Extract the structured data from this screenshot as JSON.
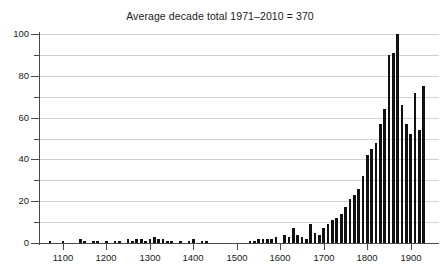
{
  "chart": {
    "title": "Average decade total 1971–2010 = 370",
    "bar_color": "#111111",
    "grid_color": "#d2d2d2",
    "axis_color": "#4a4a4a",
    "background": "#ffffff"
  },
  "chart_data": {
    "type": "bar",
    "title": "Average decade total 1971–2010 = 370",
    "xlabel": "",
    "ylabel": "",
    "xlim": [
      1045,
      1965
    ],
    "ylim": [
      0,
      100
    ],
    "grid": true,
    "grid_interval": 10,
    "legend": null,
    "x_tick_labels": [
      "1100",
      "1200",
      "1300",
      "1400",
      "1500",
      "1600",
      "1700",
      "1800",
      "1900"
    ],
    "x_tick_values": [
      1100,
      1200,
      1300,
      1400,
      1500,
      1600,
      1700,
      1800,
      1900
    ],
    "y_tick_labels": [
      "0",
      "20",
      "40",
      "60",
      "80",
      "100"
    ],
    "y_tick_values": [
      0,
      20,
      40,
      60,
      80,
      100
    ],
    "y_minor_tick_values": [
      10,
      30,
      50,
      70,
      90
    ],
    "bin_width_years": 10,
    "x": [
      1050,
      1060,
      1070,
      1080,
      1090,
      1100,
      1110,
      1120,
      1130,
      1140,
      1150,
      1160,
      1170,
      1180,
      1190,
      1200,
      1210,
      1220,
      1230,
      1240,
      1250,
      1260,
      1270,
      1280,
      1290,
      1300,
      1310,
      1320,
      1330,
      1340,
      1350,
      1360,
      1370,
      1380,
      1390,
      1400,
      1410,
      1420,
      1430,
      1440,
      1450,
      1460,
      1470,
      1480,
      1490,
      1500,
      1510,
      1520,
      1530,
      1540,
      1550,
      1560,
      1570,
      1580,
      1590,
      1600,
      1610,
      1620,
      1630,
      1640,
      1650,
      1660,
      1670,
      1680,
      1690,
      1700,
      1710,
      1720,
      1730,
      1740,
      1750,
      1760,
      1770,
      1780,
      1790,
      1800,
      1810,
      1820,
      1830,
      1840,
      1850,
      1860,
      1870,
      1880,
      1890,
      1900,
      1910,
      1920,
      1930,
      1940,
      1950
    ],
    "values": [
      0,
      0,
      1,
      0,
      0,
      1,
      0,
      0,
      0,
      2,
      1,
      0,
      1,
      1,
      0,
      1,
      0,
      1,
      1,
      0,
      2,
      1,
      2,
      2,
      1,
      2,
      3,
      2,
      2,
      1,
      1,
      0,
      1,
      0,
      1,
      2,
      0,
      1,
      1,
      0,
      0,
      0,
      0,
      0,
      0,
      0,
      0,
      0,
      1,
      1,
      2,
      2,
      2,
      2,
      3,
      0,
      4,
      3,
      7,
      4,
      3,
      2,
      9,
      5,
      4,
      7,
      9,
      11,
      12,
      14,
      17,
      21,
      23,
      26,
      32,
      42,
      45,
      48,
      57,
      64,
      90,
      91,
      100,
      66,
      57,
      52,
      72,
      54,
      75,
      0,
      0
    ]
  }
}
